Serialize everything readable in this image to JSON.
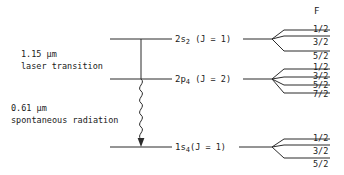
{
  "figure": {
    "type": "energy-level-diagram",
    "background_color": "#ffffff",
    "line_color": "#2b2b2b",
    "text_color": "#1a1a1a"
  },
  "hyperfine_header": {
    "label": "F"
  },
  "annotations": [
    {
      "id": "laser-transition",
      "wavelength": "1.15 µm",
      "description": "laser transition",
      "style": "straight-line"
    },
    {
      "id": "spontaneous-radiation",
      "wavelength": "0.61 µm",
      "description": "spontaneous radiation",
      "style": "wavy-line-with-arrow"
    }
  ],
  "levels": [
    {
      "id": "level-2s2",
      "term": "2s",
      "subscript": "2",
      "j_text": "(J = 1)",
      "full_label": "2s2 (J = 1)",
      "hyperfine": [
        "1/2",
        "3/2",
        "5/2"
      ]
    },
    {
      "id": "level-2p4",
      "term": "2p",
      "subscript": "4",
      "j_text": "(J = 2)",
      "full_label": "2p4 (J = 2)",
      "hyperfine": [
        "1/2",
        "3/2",
        "5/2",
        "7/2"
      ]
    },
    {
      "id": "level-1s4",
      "term": "1s",
      "subscript": "4",
      "j_text": "(J = 1)",
      "full_label": "1s4(J = 1)",
      "hyperfine": [
        "1/2",
        "3/2",
        "5/2"
      ]
    }
  ]
}
